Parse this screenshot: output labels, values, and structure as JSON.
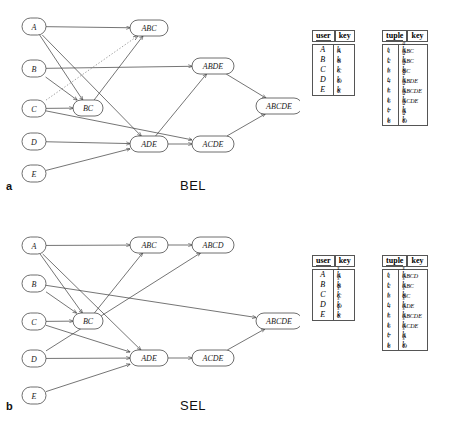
{
  "figure": {
    "panels": [
      {
        "id": "a",
        "letter": "a",
        "name": "BEL",
        "nodes": [
          {
            "id": "A",
            "label": "A",
            "x": 22,
            "y": 18,
            "w": 24,
            "h": 17,
            "shape": "rounded"
          },
          {
            "id": "ABC",
            "label": "ABC",
            "x": 130,
            "y": 20,
            "w": 38,
            "h": 16,
            "shape": "rounded"
          },
          {
            "id": "B",
            "label": "B",
            "x": 22,
            "y": 60,
            "w": 24,
            "h": 17,
            "shape": "rounded"
          },
          {
            "id": "ABDE",
            "label": "ABDE",
            "x": 192,
            "y": 58,
            "w": 42,
            "h": 16,
            "shape": "rounded"
          },
          {
            "id": "ABCDE",
            "label": "ABCDE",
            "x": 256,
            "y": 98,
            "w": 46,
            "h": 16,
            "shape": "rounded"
          },
          {
            "id": "C",
            "label": "C",
            "x": 22,
            "y": 100,
            "w": 24,
            "h": 17,
            "shape": "rounded"
          },
          {
            "id": "BC",
            "label": "BC",
            "x": 73,
            "y": 100,
            "w": 30,
            "h": 16,
            "shape": "rounded"
          },
          {
            "id": "D",
            "label": "D",
            "x": 22,
            "y": 133,
            "w": 24,
            "h": 17,
            "shape": "rounded"
          },
          {
            "id": "ADE",
            "label": "ADE",
            "x": 130,
            "y": 136,
            "w": 38,
            "h": 16,
            "shape": "rounded"
          },
          {
            "id": "ACDE",
            "label": "ACDE",
            "x": 192,
            "y": 136,
            "w": 42,
            "h": 16,
            "shape": "rounded"
          },
          {
            "id": "E",
            "label": "E",
            "x": 22,
            "y": 165,
            "w": 24,
            "h": 17,
            "shape": "rounded"
          }
        ],
        "edges": [
          {
            "from": "A",
            "to": "ABC",
            "style": "solid"
          },
          {
            "from": "A",
            "to": "BC",
            "style": "solid"
          },
          {
            "from": "A",
            "to": "ADE",
            "style": "solid"
          },
          {
            "from": "B",
            "to": "ABDE",
            "style": "solid"
          },
          {
            "from": "B",
            "to": "BC",
            "style": "solid"
          },
          {
            "from": "C",
            "to": "BC",
            "style": "solid"
          },
          {
            "from": "C",
            "to": "ABC",
            "style": "dotted"
          },
          {
            "from": "C",
            "to": "ACDE",
            "style": "solid"
          },
          {
            "from": "BC",
            "to": "ABC",
            "style": "solid"
          },
          {
            "from": "D",
            "to": "ADE",
            "style": "solid"
          },
          {
            "from": "E",
            "to": "ADE",
            "style": "solid"
          },
          {
            "from": "ADE",
            "to": "ACDE",
            "style": "solid"
          },
          {
            "from": "ADE",
            "to": "ABDE",
            "style": "solid"
          },
          {
            "from": "ABDE",
            "to": "ABCDE",
            "style": "solid"
          },
          {
            "from": "ACDE",
            "to": "ABCDE",
            "style": "solid"
          }
        ],
        "user_table": {
          "headers": [
            "user",
            "key"
          ],
          "rows": [
            {
              "user": "A",
              "key_base": "k",
              "key_sub": "A",
              "key_sup": ""
            },
            {
              "user": "B",
              "key_base": "k",
              "key_sub": "B",
              "key_sup": ""
            },
            {
              "user": "C",
              "key_base": "k",
              "key_sub": "C",
              "key_sup": ""
            },
            {
              "user": "D",
              "key_base": "k",
              "key_sub": "D",
              "key_sup": ""
            },
            {
              "user": "E",
              "key_base": "k",
              "key_sub": "E",
              "key_sup": ""
            }
          ]
        },
        "tuple_table": {
          "headers": [
            "tuple",
            "key"
          ],
          "rows": [
            {
              "tuple": "t",
              "tuple_sub": "1",
              "key_base": "k",
              "key_sub": "ABC",
              "key_sup": "a"
            },
            {
              "tuple": "t",
              "tuple_sub": "2",
              "key_base": "k",
              "key_sub": "ABC",
              "key_sup": "a"
            },
            {
              "tuple": "t",
              "tuple_sub": "3",
              "key_base": "k",
              "key_sub": "BC",
              "key_sup": "a"
            },
            {
              "tuple": "t",
              "tuple_sub": "4",
              "key_base": "k",
              "key_sub": "ABDE",
              "key_sup": "a"
            },
            {
              "tuple": "t",
              "tuple_sub": "5",
              "key_base": "k",
              "key_sub": "ABCDE",
              "key_sup": "a"
            },
            {
              "tuple": "t",
              "tuple_sub": "6",
              "key_base": "k",
              "key_sub": "ACDE",
              "key_sup": "a"
            },
            {
              "tuple": "t",
              "tuple_sub": "7",
              "key_base": "k",
              "key_sub": "A",
              "key_sup": "a"
            },
            {
              "tuple": "t",
              "tuple_sub": "8",
              "key_base": "k",
              "key_sub": "D",
              "key_sup": "a"
            }
          ]
        }
      },
      {
        "id": "b",
        "letter": "b",
        "name": "SEL",
        "nodes": [
          {
            "id": "A",
            "label": "A",
            "x": 22,
            "y": 27,
            "w": 24,
            "h": 17,
            "shape": "rounded"
          },
          {
            "id": "ABC",
            "label": "ABC",
            "x": 130,
            "y": 27,
            "w": 38,
            "h": 16,
            "shape": "rounded"
          },
          {
            "id": "ABCD",
            "label": "ABCD",
            "x": 192,
            "y": 27,
            "w": 42,
            "h": 16,
            "shape": "rounded"
          },
          {
            "id": "B",
            "label": "B",
            "x": 22,
            "y": 65,
            "w": 24,
            "h": 17,
            "shape": "rounded"
          },
          {
            "id": "C",
            "label": "C",
            "x": 22,
            "y": 103,
            "w": 24,
            "h": 17,
            "shape": "rounded"
          },
          {
            "id": "BC",
            "label": "BC",
            "x": 73,
            "y": 103,
            "w": 30,
            "h": 16,
            "shape": "rounded"
          },
          {
            "id": "ABCDE",
            "label": "ABCDE",
            "x": 256,
            "y": 103,
            "w": 46,
            "h": 16,
            "shape": "rounded"
          },
          {
            "id": "D",
            "label": "D",
            "x": 22,
            "y": 140,
            "w": 24,
            "h": 17,
            "shape": "rounded"
          },
          {
            "id": "ADE",
            "label": "ADE",
            "x": 130,
            "y": 140,
            "w": 38,
            "h": 16,
            "shape": "rounded"
          },
          {
            "id": "ACDE",
            "label": "ACDE",
            "x": 192,
            "y": 140,
            "w": 42,
            "h": 16,
            "shape": "rounded"
          },
          {
            "id": "E",
            "label": "E",
            "x": 22,
            "y": 177,
            "w": 24,
            "h": 17,
            "shape": "rounded"
          }
        ],
        "edges": [
          {
            "from": "A",
            "to": "ABC",
            "style": "solid"
          },
          {
            "from": "A",
            "to": "BC",
            "style": "solid"
          },
          {
            "from": "A",
            "to": "ADE",
            "style": "solid"
          },
          {
            "from": "B",
            "to": "BC",
            "style": "solid"
          },
          {
            "from": "B",
            "to": "ABCDE",
            "style": "solid"
          },
          {
            "from": "C",
            "to": "BC",
            "style": "solid"
          },
          {
            "from": "C",
            "to": "ADE",
            "style": "solid"
          },
          {
            "from": "BC",
            "to": "ABC",
            "style": "solid"
          },
          {
            "from": "D",
            "to": "ABCD",
            "style": "solid"
          },
          {
            "from": "D",
            "to": "ADE",
            "style": "solid"
          },
          {
            "from": "E",
            "to": "ADE",
            "style": "solid"
          },
          {
            "from": "ABC",
            "to": "ABCD",
            "style": "solid"
          },
          {
            "from": "ADE",
            "to": "ACDE",
            "style": "solid"
          },
          {
            "from": "ACDE",
            "to": "ABCDE",
            "style": "solid"
          }
        ],
        "user_table": {
          "headers": [
            "user",
            "key"
          ],
          "rows": [
            {
              "user": "A",
              "key_base": "k",
              "key_sub": "A",
              "key_sup": "s"
            },
            {
              "user": "B",
              "key_base": "k",
              "key_sub": "B",
              "key_sup": "s"
            },
            {
              "user": "C",
              "key_base": "k",
              "key_sub": "C",
              "key_sup": "s"
            },
            {
              "user": "D",
              "key_base": "k",
              "key_sub": "D",
              "key_sup": "s"
            },
            {
              "user": "E",
              "key_base": "k",
              "key_sub": "E",
              "key_sup": "s"
            }
          ]
        },
        "tuple_table": {
          "headers": [
            "tuple",
            "key"
          ],
          "rows": [
            {
              "tuple": "t",
              "tuple_sub": "1",
              "key_base": "k",
              "key_sub": "ABCD",
              "key_sup": "s"
            },
            {
              "tuple": "t",
              "tuple_sub": "2",
              "key_base": "k",
              "key_sub": "ABC",
              "key_sup": "s"
            },
            {
              "tuple": "t",
              "tuple_sub": "3",
              "key_base": "k",
              "key_sub": "BC",
              "key_sup": "s"
            },
            {
              "tuple": "t",
              "tuple_sub": "4",
              "key_base": "k",
              "key_sub": "ADE",
              "key_sup": "s"
            },
            {
              "tuple": "t",
              "tuple_sub": "5",
              "key_base": "k",
              "key_sub": "ABCDE",
              "key_sup": "s"
            },
            {
              "tuple": "t",
              "tuple_sub": "6",
              "key_base": "k",
              "key_sub": "ACDE",
              "key_sup": "s"
            },
            {
              "tuple": "t",
              "tuple_sub": "7",
              "key_base": "k",
              "key_sub": "A",
              "key_sup": "s"
            },
            {
              "tuple": "t",
              "tuple_sub": "8",
              "key_base": "k",
              "key_sub": "D",
              "key_sup": "s"
            }
          ]
        }
      }
    ],
    "colors": {
      "node_stroke": "#4a4a4a",
      "edge": "#3a3a3a",
      "edge_dotted": "#8a8a8a",
      "table_border": "#555555",
      "background": "#ffffff"
    }
  }
}
